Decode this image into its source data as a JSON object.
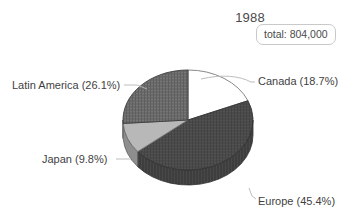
{
  "chart_title": "1988",
  "total_box": {
    "label": "total: 804,000"
  },
  "labels": {
    "canada": "Canada (18.7%)",
    "latin_america": "Latin America (26.1%)",
    "japan": "Japan (9.8%)",
    "europe": "Europe (45.4%)"
  },
  "chart_data": {
    "type": "pie",
    "title": "1988",
    "annotations": [
      "total: 804,000"
    ],
    "total": 804000,
    "total_label": "total: 804,000",
    "units": "units",
    "legend_position": "callout-labels",
    "grid": false,
    "three_d": true,
    "categories": [
      "Canada",
      "Europe",
      "Japan",
      "Latin America"
    ],
    "values": [
      18.7,
      45.4,
      9.8,
      26.1
    ],
    "value_unit": "percent",
    "absolute_values": [
      150348,
      365016,
      78792,
      209844
    ],
    "slice_labels": [
      "Canada (18.7%)",
      "Europe (45.4%)",
      "Japan (9.8%)",
      "Latin America (26.1%)"
    ],
    "colors": [
      "#ffffff",
      "#4a4a4a",
      "#b8b8b8",
      "#6a6a6a"
    ],
    "side_colors": [
      "#9a9a9a",
      "#3a3a3a",
      "#8a8a8a",
      "#4f4f4f"
    ],
    "start_angle_deg": 0,
    "direction": "clockwise",
    "xlabel": "",
    "ylabel": ""
  },
  "colors": {
    "background": "#ffffff",
    "text": "#3f3f3f",
    "outline": "#7a7a7a",
    "leader_line": "#b5b5b5",
    "box_border": "#c9c9c9"
  }
}
